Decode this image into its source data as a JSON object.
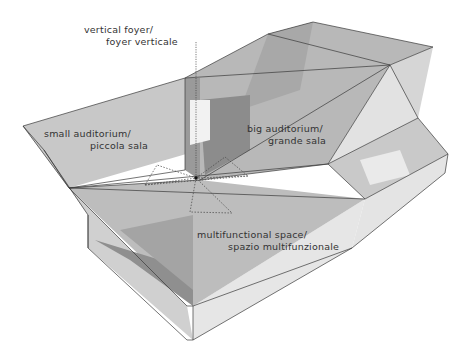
{
  "diagram": {
    "type": "architectural axonometric",
    "labels": {
      "vertical_foyer": {
        "line1": "vertical foyer/",
        "line2": "foyer verticale"
      },
      "small_auditorium": {
        "line1": "small auditorium/",
        "line2": "piccola sala"
      },
      "big_auditorium": {
        "line1": "big auditorium/",
        "line2": "grande sala"
      },
      "multifunctional_space": {
        "line1": "multifunctional space/",
        "line2": "spazio multifunzionale"
      }
    },
    "colors": {
      "background": "#ffffff",
      "edge": "#3a3a3a",
      "text": "#333333",
      "dark_volume": "#8a8a8a",
      "mid_volume": "#b4b4b4",
      "light_volume": "#d8d8d8"
    }
  }
}
